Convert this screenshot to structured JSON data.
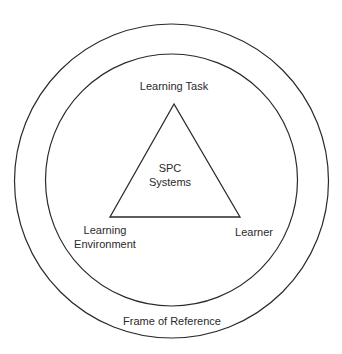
{
  "diagram": {
    "type": "concentric-circles-with-triangle",
    "outer_circle": {
      "label": "Frame of Reference"
    },
    "inner_circle": {
      "label": ""
    },
    "triangle": {
      "center_label_line1": "SPC",
      "center_label_line2": "Systems",
      "vertices": {
        "top": "Learning Task",
        "bottom_left_line1": "Learning",
        "bottom_left_line2": "Environment",
        "bottom_right": "Learner"
      }
    },
    "colors": {
      "stroke": "#2a2a2a",
      "text": "#2a2a2a",
      "background": "#ffffff"
    }
  }
}
